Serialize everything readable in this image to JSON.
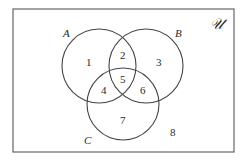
{
  "diagram": {
    "type": "venn",
    "universe_label": "𝒰",
    "sets": [
      {
        "label": "A",
        "cx": 99,
        "cy": 66,
        "r": 37
      },
      {
        "label": "B",
        "cx": 146,
        "cy": 66,
        "r": 37
      },
      {
        "label": "C",
        "cx": 123,
        "cy": 104,
        "r": 36
      }
    ],
    "regions": [
      "1",
      "2",
      "3",
      "4",
      "5",
      "6",
      "7",
      "8"
    ],
    "colors": {
      "stroke": "#444444",
      "border": "#666666",
      "background": "#ffffff"
    }
  }
}
